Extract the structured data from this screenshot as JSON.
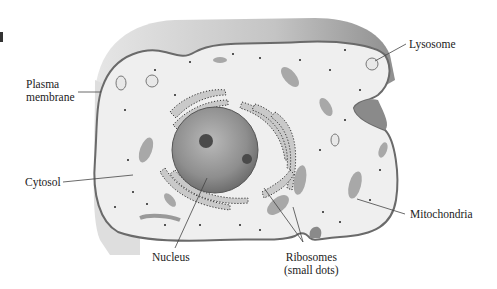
{
  "figure": {
    "type": "animal-cell-diagram",
    "labels": {
      "plasma_membrane_line1": "Plasma",
      "plasma_membrane_line2": "membrane",
      "cytosol": "Cytosol",
      "nucleus": "Nucleus",
      "ribosomes_line1": "Ribosomes",
      "ribosomes_line2": "(small dots)",
      "lysosome": "Lysosome",
      "mitochondria": "Mitochondria"
    },
    "colors": {
      "cell_3d_edge": "#d2d2d2",
      "cell_top_dark": "#9a9a9a",
      "cytosol_fill": "#efefef",
      "membrane": "#6a6a6a",
      "nucleus": "#8f8f8f",
      "nucleolus": "#4a4a4a",
      "er": "#c8c8c8",
      "mitochondria": "#a8a8a8",
      "leader_line": "#444444"
    }
  }
}
